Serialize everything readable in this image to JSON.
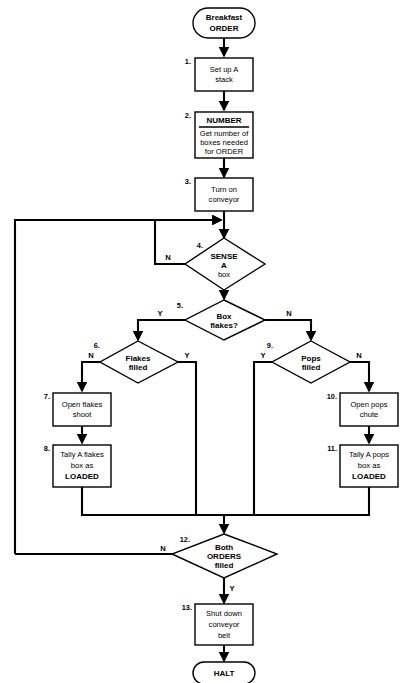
{
  "diagram": {
    "stroke_color": "#000000",
    "fill_color": "#ffffff",
    "background": "#ffffff"
  },
  "terminals": {
    "start": {
      "line1": "Breakfast",
      "line2": "ORDER"
    },
    "end": {
      "line1": "HALT"
    }
  },
  "steps": [
    {
      "num": "1.",
      "type": "process",
      "lines": [
        "Set up A",
        "stack"
      ]
    },
    {
      "num": "2.",
      "type": "process-with-header",
      "header": "NUMBER",
      "lines": [
        "Get number of",
        "boxes needed",
        "for ORDER"
      ]
    },
    {
      "num": "3.",
      "type": "process",
      "lines": [
        "Turn on",
        "conveyor"
      ]
    },
    {
      "num": "4.",
      "type": "decision",
      "lines": [
        "SENSE",
        "A",
        "box"
      ],
      "no_label": "N"
    },
    {
      "num": "5.",
      "type": "decision",
      "lines": [
        "Box",
        "flakes?"
      ],
      "yes_label": "Y",
      "no_label": "N"
    },
    {
      "num": "6.",
      "type": "decision",
      "lines": [
        "Flakes",
        "filled"
      ],
      "yes_label": "Y",
      "no_label": "N"
    },
    {
      "num": "7.",
      "type": "process",
      "lines": [
        "Open flakes",
        "shoot"
      ]
    },
    {
      "num": "8.",
      "type": "process",
      "lines": [
        "Tally A flakes",
        "box as",
        "LOADED"
      ]
    },
    {
      "num": "9.",
      "type": "decision",
      "lines": [
        "Pops",
        "filled"
      ],
      "yes_label": "Y",
      "no_label": "N"
    },
    {
      "num": "10.",
      "type": "process",
      "lines": [
        "Open pops",
        "chute"
      ]
    },
    {
      "num": "11.",
      "type": "process",
      "lines": [
        "Tally A pops",
        "box as",
        "LOADED"
      ]
    },
    {
      "num": "12.",
      "type": "decision",
      "lines": [
        "Both",
        "ORDERS",
        "filled"
      ],
      "yes_label": "Y",
      "no_label": "N"
    },
    {
      "num": "13.",
      "type": "process",
      "lines": [
        "Shut down",
        "conveyor",
        "belt"
      ]
    }
  ]
}
